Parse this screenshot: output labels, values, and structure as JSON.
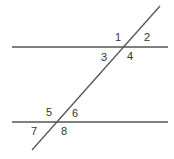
{
  "diagram": {
    "type": "parallel-lines-cut-by-transversal",
    "line_color": "#555555",
    "label_color": "#333333",
    "lines": {
      "top_parallel": {
        "x1": 12,
        "y1": 47,
        "x2": 168,
        "y2": 47
      },
      "bottom_parallel": {
        "x1": 12,
        "y1": 122,
        "x2": 168,
        "y2": 122
      },
      "transversal": {
        "x1": 160,
        "y1": 6,
        "x2": 32,
        "y2": 150
      }
    },
    "angles": [
      {
        "label": "1",
        "x": 115,
        "y": 41
      },
      {
        "label": "2",
        "x": 144,
        "y": 41
      },
      {
        "label": "3",
        "x": 101,
        "y": 61
      },
      {
        "label": "4",
        "x": 127,
        "y": 60
      },
      {
        "label": "5",
        "x": 46,
        "y": 116
      },
      {
        "label": "6",
        "x": 72,
        "y": 117
      },
      {
        "label": "7",
        "x": 31,
        "y": 135
      },
      {
        "label": "8",
        "x": 61,
        "y": 135
      }
    ]
  }
}
